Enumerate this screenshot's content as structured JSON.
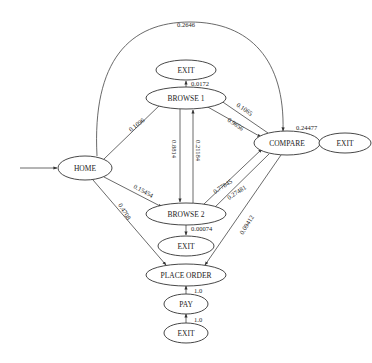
{
  "diagram": {
    "type": "state-transition",
    "nodes": {
      "home": "HOME",
      "browse1": "BROWSE 1",
      "browse2": "BROWSE 2",
      "compare": "COMPARE",
      "place_order": "PLACE ORDER",
      "pay": "PAY",
      "exit_top": "EXIT",
      "exit_b2": "EXIT",
      "exit_right": "EXIT",
      "exit_bottom": "EXIT"
    },
    "edges": {
      "home_compare": "0.2646",
      "browse1_exit": "0.0172",
      "home_browse1": "0.1096",
      "compare_browse1": "0.1065",
      "browse1_compare": "0.9656",
      "browse1_browse2": "0.8814",
      "browse2_browse1": "0.21184",
      "home_browse2": "0.15454",
      "browse2_compare": "0.77845",
      "compare_browse2": "0.27481",
      "compare_exit": "0.24477",
      "browse2_exit": "0.00074",
      "home_place_order": "0.4708",
      "compare_place_order": "0.09412",
      "place_order_pay": "1.0",
      "pay_exit": "1.0"
    }
  }
}
